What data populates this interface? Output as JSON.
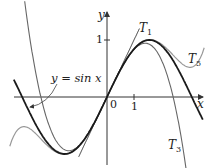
{
  "figure": {
    "labels": {
      "y_axis": "y",
      "x_axis": "x",
      "origin": "0",
      "x_tick_1": "1",
      "y_tick_1": "1",
      "curve_label": "y = sin x",
      "t1": {
        "main": "T",
        "sub": "1"
      },
      "t3": {
        "main": "T",
        "sub": "3"
      },
      "t5": {
        "main": "T",
        "sub": "5"
      }
    },
    "colors": {
      "sin": "#1a1a1a",
      "t1": "#333333",
      "t3": "#666666",
      "t5": "#9a9a9a",
      "axes": "#333333"
    }
  },
  "chart_data": {
    "type": "line",
    "title": "",
    "xlabel": "x",
    "ylabel": "y",
    "x_ticks": [
      "0",
      "1"
    ],
    "y_ticks": [
      "1"
    ],
    "xlim": [
      -3.4,
      3.6
    ],
    "ylim": [
      -1.25,
      1.5
    ],
    "series": [
      {
        "name": "y = sin x",
        "function": "sin(x)"
      },
      {
        "name": "T1",
        "function": "x"
      },
      {
        "name": "T3",
        "function": "x - x^3/6"
      },
      {
        "name": "T5",
        "function": "x - x^3/6 + x^5/120"
      }
    ]
  }
}
